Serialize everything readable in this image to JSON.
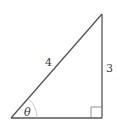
{
  "diagram": {
    "type": "right-triangle",
    "hypotenuse_label": "4",
    "opposite_label": "3",
    "angle_label": "θ",
    "right_angle_marker": true,
    "stroke_color": "#555555",
    "arc_color": "#bbbbbb"
  }
}
